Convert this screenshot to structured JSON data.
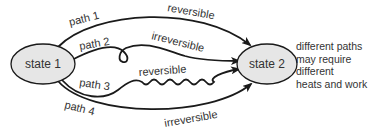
{
  "diagram": {
    "nodes": [
      {
        "id": "state1",
        "label": "state 1"
      },
      {
        "id": "state2",
        "label": "state 2"
      }
    ],
    "paths": [
      {
        "name": "path 1",
        "type": "reversible"
      },
      {
        "name": "path 2",
        "type": "irreversible"
      },
      {
        "name": "path 3",
        "type": "reversible"
      },
      {
        "name": "path 4",
        "type": "irreversible"
      }
    ],
    "note_lines": [
      "different paths",
      "may require",
      "different",
      "heats and work"
    ],
    "colors": {
      "node_fill": "#e6e6e6",
      "stroke": "#1a1a1a",
      "text": "#333333"
    }
  }
}
